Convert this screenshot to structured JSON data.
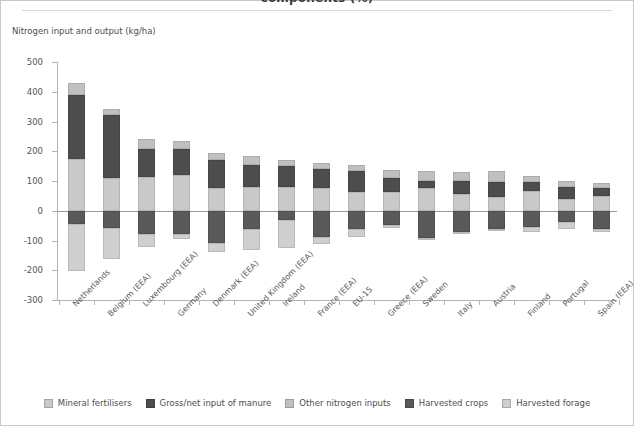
{
  "header": {
    "title_clipped": "components (%)",
    "subtitle": "Nitrogen input and output (kg/ha)"
  },
  "colors": {
    "mineral_fertilisers": "#c9c9c9",
    "gross_net_input_of_manure": "#4d4d4d",
    "other_nitrogen_inputs": "#c0c0c0",
    "harvested_crops": "#595959",
    "harvested_forage": "#cfcfcf",
    "axis": "#b4b4b4",
    "zero_line": "#9a9a9a",
    "text": "#4d4d4d",
    "frame": "#c8c8c8"
  },
  "legend": {
    "position": "bottom",
    "items": [
      {
        "label": "Mineral fertilisers",
        "key": "mineral_fertilisers"
      },
      {
        "label": "Gross/net input of manure",
        "key": "gross_net_input_of_manure"
      },
      {
        "label": "Other nitrogen inputs",
        "key": "other_nitrogen_inputs"
      },
      {
        "label": "Harvested crops",
        "key": "harvested_crops"
      },
      {
        "label": "Harvested forage",
        "key": "harvested_forage"
      }
    ]
  },
  "chart_data": {
    "type": "bar",
    "subtype": "stacked-diverging",
    "title": "components (%)",
    "xlabel": "",
    "ylabel": "Nitrogen input and output (kg/ha)",
    "ylim": [
      -300,
      500
    ],
    "yticks": [
      500,
      400,
      300,
      200,
      100,
      0,
      -100,
      -200,
      -300
    ],
    "grid": false,
    "zero_reference": 0,
    "categories": [
      "Netherlands",
      "Belgium (EEA)",
      "Luxembourg (EEA)",
      "Germany",
      "Denmark (EEA)",
      "United Kingdom (EEA)",
      "Ireland",
      "France (EEA)",
      "EU-15",
      "Greece (EEA)",
      "Sweden",
      "Italy",
      "Austria",
      "Finland",
      "Portugal",
      "Spain (EEA)"
    ],
    "series": [
      {
        "name": "Mineral fertilisers",
        "key": "mineral_fertilisers",
        "direction": "positive",
        "values": [
          175,
          110,
          113,
          120,
          78,
          80,
          80,
          78,
          63,
          62,
          78,
          55,
          45,
          66,
          40,
          48
        ]
      },
      {
        "name": "Gross/net input of manure",
        "key": "gross_net_input_of_manure",
        "direction": "positive",
        "values": [
          213,
          213,
          96,
          88,
          92,
          75,
          72,
          62,
          70,
          48,
          22,
          45,
          52,
          31,
          40,
          30
        ]
      },
      {
        "name": "Other nitrogen inputs",
        "key": "other_nitrogen_inputs",
        "direction": "positive",
        "values": [
          43,
          19,
          33,
          28,
          23,
          28,
          18,
          20,
          22,
          28,
          32,
          30,
          38,
          21,
          21,
          14
        ]
      },
      {
        "name": "Harvested crops",
        "key": "harvested_crops",
        "direction": "negative",
        "values": [
          -46,
          -58,
          -78,
          -78,
          -108,
          -62,
          -32,
          -88,
          -62,
          -49,
          -91,
          -70,
          -60,
          -55,
          -38,
          -60
        ]
      },
      {
        "name": "Harvested forage",
        "key": "harvested_forage",
        "direction": "negative",
        "values": [
          -158,
          -103,
          -44,
          -16,
          -30,
          -70,
          -92,
          -25,
          -25,
          -10,
          -2,
          -6,
          -8,
          -17,
          -25,
          -12
        ]
      }
    ]
  }
}
